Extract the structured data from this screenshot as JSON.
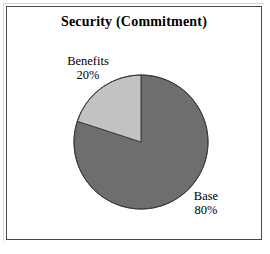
{
  "chart": {
    "title": "Security (Commitment)",
    "frame_color": "#4a4a4a",
    "background": "#ffffff"
  },
  "labels": {
    "benefits": {
      "name": "Benefits",
      "value": "20%"
    },
    "base": {
      "name": "Base",
      "value": "80%"
    }
  },
  "chart_data": {
    "type": "pie",
    "title": "Security (Commitment)",
    "subtitle": "",
    "xlabel": "",
    "ylabel": "",
    "categories": [
      "Base",
      "Benefits"
    ],
    "values": [
      80,
      20
    ],
    "value_unit": "percent",
    "data_labels": [
      "Base 80%",
      "Benefits 20%"
    ],
    "slices": [
      {
        "label": "Base",
        "value": 80,
        "display_value": "80%",
        "color": "#6e6e6e",
        "start_angle_deg": 0,
        "end_angle_deg": 288,
        "direction": "clockwise-from-12-oclock"
      },
      {
        "label": "Benefits",
        "value": 20,
        "display_value": "20%",
        "color": "#c2c2c2",
        "start_angle_deg": 288,
        "end_angle_deg": 360,
        "direction": "clockwise-from-12-oclock"
      }
    ],
    "total": 100,
    "start_angle_deg": 0,
    "legend": "none",
    "legend_position": "none",
    "grid": false,
    "slice_outline_color": "#3c3c3c",
    "annotations": []
  }
}
